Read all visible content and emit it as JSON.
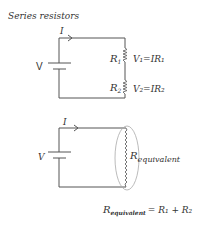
{
  "title": "Series resistors",
  "top_circuit": {
    "voltage_label": "V",
    "current_label": "I",
    "resistors": [
      {
        "label": "R",
        "sub": "1",
        "equation": "V₁=IR₁"
      },
      {
        "label": "R",
        "sub": "2",
        "equation": "V₂=IR₂"
      }
    ]
  },
  "bottom_circuit": {
    "voltage_label": "V",
    "current_label": "I",
    "equivalent_label": "R",
    "equivalent_sub": "equivalent"
  },
  "formula": {
    "lhs": "R",
    "lhs_sub": "equivalent",
    "rhs": "= R₁ + R₂"
  },
  "colors": {
    "ink": "#333333",
    "ellipse": "#aaaaaa"
  }
}
